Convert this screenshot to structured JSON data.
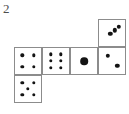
{
  "figure": {
    "label": "2",
    "type": "dice-net",
    "colors": {
      "background": "#ffffff",
      "cell_border": "#8c8c8c",
      "pip": "#141414",
      "label_text": "#4d4d4d"
    },
    "grid": {
      "columns": 4,
      "rows": 3,
      "cell_width": 28,
      "cell_height": 28,
      "origin_x": 14,
      "origin_y": 19
    },
    "cells": [
      {
        "id": "cell-top-col4",
        "name": "die-face-three",
        "value": 3,
        "row": 0,
        "col": 3,
        "pips": [
          {
            "x": 76,
            "y": 26
          },
          {
            "x": 60,
            "y": 40
          },
          {
            "x": 44,
            "y": 53
          }
        ]
      },
      {
        "id": "cell-mid-col1",
        "name": "die-face-four",
        "value": 4,
        "row": 1,
        "col": 0,
        "pips": [
          {
            "x": 28,
            "y": 28
          },
          {
            "x": 72,
            "y": 28
          },
          {
            "x": 28,
            "y": 72
          },
          {
            "x": 72,
            "y": 72
          }
        ]
      },
      {
        "id": "cell-mid-col2",
        "name": "die-face-six",
        "value": 6,
        "row": 1,
        "col": 1,
        "pips": [
          {
            "x": 31,
            "y": 24
          },
          {
            "x": 69,
            "y": 24
          },
          {
            "x": 31,
            "y": 50
          },
          {
            "x": 69,
            "y": 50
          },
          {
            "x": 31,
            "y": 76
          },
          {
            "x": 69,
            "y": 76
          }
        ]
      },
      {
        "id": "cell-mid-col3",
        "name": "die-face-one",
        "value": 1,
        "row": 1,
        "col": 2,
        "pips": [
          {
            "x": 50,
            "y": 50
          }
        ]
      },
      {
        "id": "cell-mid-col4",
        "name": "die-face-two",
        "value": 2,
        "row": 1,
        "col": 3,
        "pips": [
          {
            "x": 33,
            "y": 30
          },
          {
            "x": 70,
            "y": 68
          }
        ]
      },
      {
        "id": "cell-bottom-col1",
        "name": "die-face-five",
        "value": 5,
        "row": 2,
        "col": 0,
        "pips": [
          {
            "x": 28,
            "y": 27
          },
          {
            "x": 72,
            "y": 27
          },
          {
            "x": 50,
            "y": 50
          },
          {
            "x": 28,
            "y": 73
          },
          {
            "x": 72,
            "y": 73
          }
        ]
      }
    ]
  }
}
